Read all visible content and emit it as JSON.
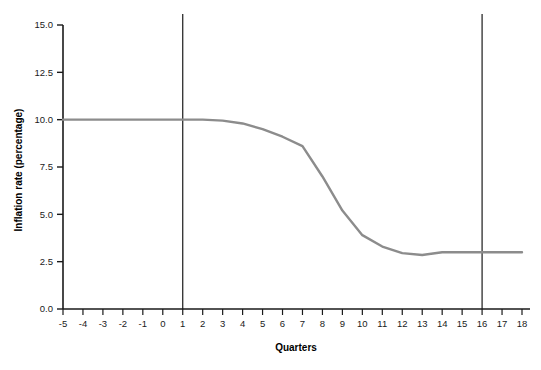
{
  "chart_data": {
    "type": "line",
    "title": "",
    "xlabel": "Quarters",
    "ylabel": "Inflation rate (percentage)",
    "xlim": [
      -5,
      18
    ],
    "ylim": [
      0.0,
      15.0
    ],
    "grid": false,
    "legend": "none",
    "line_color": "#8c8c8c",
    "axis_color": "#1a1a1a",
    "reference_line_color": "#1a1a1a",
    "x_ticks": [
      -5,
      -4,
      -3,
      -2,
      -1,
      0,
      1,
      2,
      3,
      4,
      5,
      6,
      7,
      8,
      9,
      10,
      11,
      12,
      13,
      14,
      15,
      16,
      17,
      18
    ],
    "x_tick_labels": [
      "-5",
      "-4",
      "-3",
      "-2",
      "-1",
      "0",
      "1",
      "2",
      "3",
      "4",
      "5",
      "6",
      "7",
      "8",
      "9",
      "10",
      "11",
      "12",
      "13",
      "14",
      "15",
      "16",
      "17",
      "18"
    ],
    "y_ticks": [
      0.0,
      2.5,
      5.0,
      7.5,
      10.0,
      12.5,
      15.0
    ],
    "y_tick_labels": [
      "0.0",
      "2.5",
      "5.0",
      "7.5",
      "10.0",
      "12.5",
      "15.0"
    ],
    "reference_lines": [
      {
        "name": "policy-start",
        "x": 1
      },
      {
        "name": "policy-end",
        "x": 16
      }
    ],
    "series": [
      {
        "name": "inflation-rate",
        "x": [
          -5,
          -4,
          -3,
          -2,
          -1,
          0,
          1,
          2,
          3,
          4,
          5,
          6,
          7,
          8,
          9,
          10,
          11,
          12,
          13,
          14,
          15,
          16,
          17,
          18
        ],
        "values": [
          10.0,
          10.0,
          10.0,
          10.0,
          10.0,
          10.0,
          10.0,
          10.0,
          9.95,
          9.8,
          9.5,
          9.1,
          8.6,
          7.0,
          5.2,
          3.9,
          3.3,
          2.95,
          2.85,
          3.0,
          3.0,
          3.0,
          3.0,
          3.0
        ]
      }
    ]
  }
}
